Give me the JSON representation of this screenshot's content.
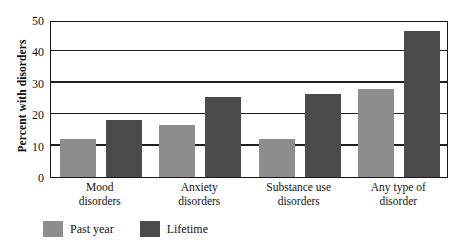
{
  "chart_data": {
    "type": "bar",
    "title": "",
    "subtitle": "",
    "xlabel": "",
    "ylabel": "Percent with disorders",
    "ylim": [
      0,
      50
    ],
    "yticks": [
      0,
      10,
      20,
      30,
      40,
      50
    ],
    "ytick_labels": [
      "0",
      "10",
      "20",
      "30",
      "40",
      "50"
    ],
    "grid": "horizontal",
    "legend_position": "bottom-left",
    "categories": [
      "Mood disorders",
      "Anxiety disorders",
      "Substance use disorders",
      "Any type of disorder"
    ],
    "category_lines": [
      [
        "Mood",
        "disorders"
      ],
      [
        "Anxiety",
        "disorders"
      ],
      [
        "Substance use",
        "disorders"
      ],
      [
        "Any type of",
        "disorder"
      ]
    ],
    "series": [
      {
        "name": "Past year",
        "color": "#8d8d8d",
        "values": [
          12.0,
          16.5,
          12.0,
          28.0
        ]
      },
      {
        "name": "Lifetime",
        "color": "#4b4b4b",
        "values": [
          18.0,
          25.5,
          26.5,
          46.5
        ]
      }
    ]
  },
  "axis": {
    "y_title": "Percent with disorders",
    "ticks": [
      "50",
      "40",
      "30",
      "20",
      "10",
      "0"
    ]
  },
  "legend": {
    "items": [
      {
        "label": "Past year",
        "color": "#8d8d8d"
      },
      {
        "label": "Lifetime",
        "color": "#4b4b4b"
      }
    ]
  },
  "colors": {
    "past_year": "#8d8d8d",
    "lifetime": "#4b4b4b",
    "axis": "#1a1a1a",
    "background": "#ffffff"
  }
}
